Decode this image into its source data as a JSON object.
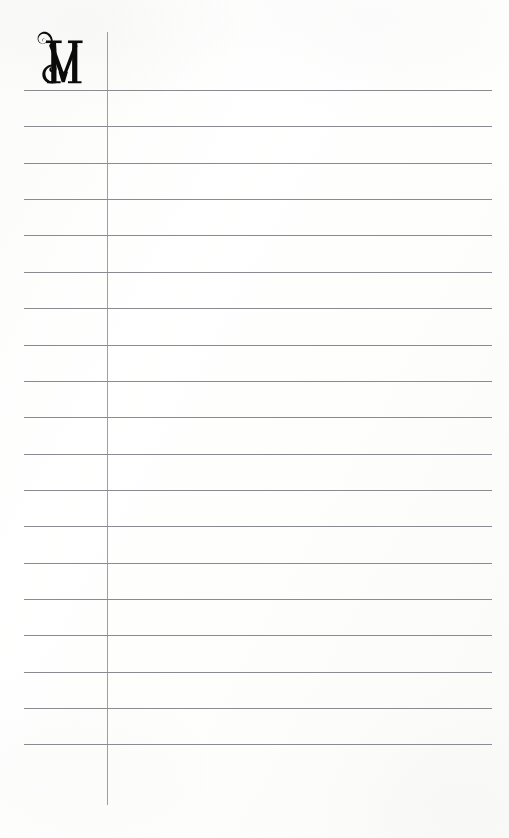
{
  "document": {
    "kind": "ruled-manuscript-page",
    "title": "Ruled Manuscript Page",
    "width": 509,
    "height": 838
  },
  "colors": {
    "paper": "#fdfdfc",
    "rule_line": "#808088",
    "margin_rule": "#8d8d94",
    "ink": "#0b0b0c"
  },
  "initial": {
    "letter": "M",
    "style": "decorative swash serif capital",
    "center_x": 62,
    "baseline_y": 90,
    "cap_height": 58
  },
  "margin_rule": {
    "x": 107,
    "y_start": 32,
    "y_end": 805,
    "thickness": 1.3
  },
  "rules": {
    "count": 19,
    "first_y": 90,
    "spacing": 36.35,
    "x_start": 24,
    "x_end": 492,
    "thickness": 1.3,
    "y_positions": [
      90,
      126.4,
      162.7,
      199.1,
      235.4,
      271.8,
      308.1,
      344.5,
      380.8,
      417.2,
      453.5,
      489.9,
      526.2,
      562.6,
      598.9,
      635.3,
      671.6,
      708.0,
      744.3
    ]
  }
}
